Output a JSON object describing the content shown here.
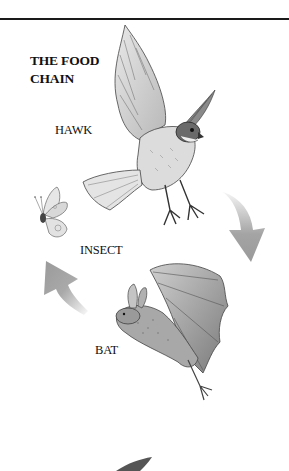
{
  "title": {
    "line1": "THE FOOD",
    "line2": "CHAIN"
  },
  "labels": {
    "hawk": "HAWK",
    "insect": "INSECT",
    "bat": "BAT"
  },
  "colors": {
    "rule": "#1a1a1a",
    "arrow": "#9a9a9a",
    "ink": "#111111",
    "background": "#ffffff"
  },
  "icons": {
    "hawk": "hawk-illustration",
    "insect": "butterfly-illustration",
    "bat": "bat-illustration",
    "arrow_hawk_to_bat": "curved-arrow-down",
    "arrow_bat_to_insect": "curved-arrow-up-left"
  }
}
